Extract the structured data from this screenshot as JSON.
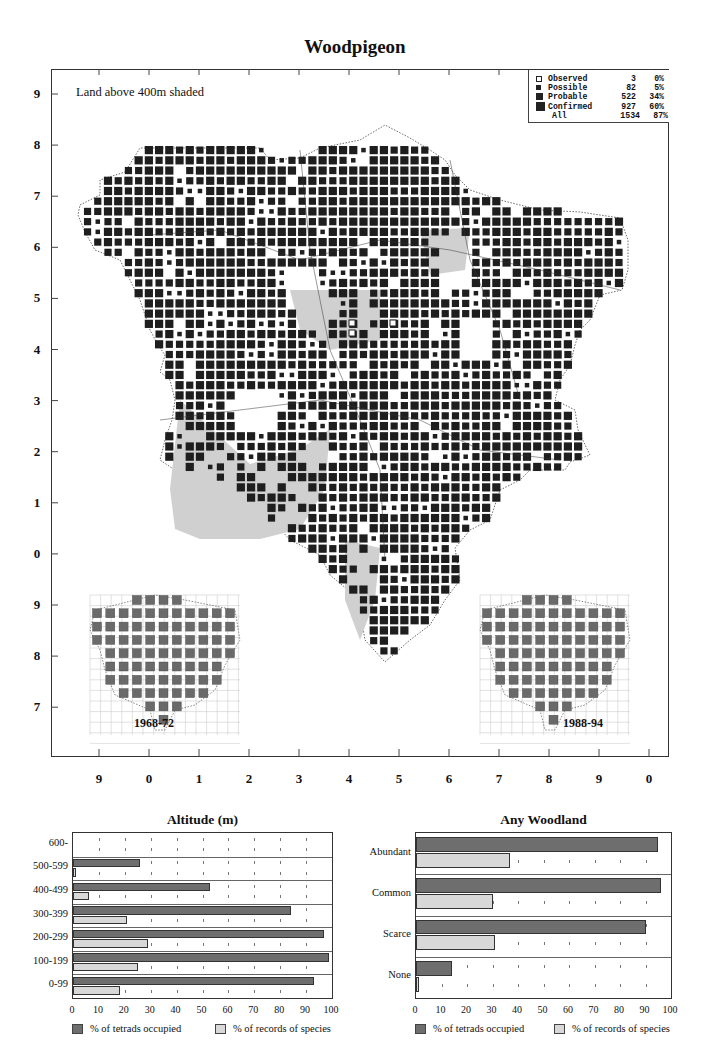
{
  "title": "Woodpigeon",
  "map": {
    "shade_note": "Land above 400m shaded",
    "y_ticks": [
      "9",
      "8",
      "7",
      "6",
      "5",
      "4",
      "3",
      "2",
      "1",
      "0",
      "9",
      "8",
      "7"
    ],
    "x_ticks": [
      "9",
      "0",
      "1",
      "2",
      "3",
      "4",
      "5",
      "6",
      "7",
      "8",
      "9",
      "0"
    ],
    "legend": [
      {
        "label": "Observed",
        "count": "3",
        "pct": "0%",
        "symbol": "open-square"
      },
      {
        "label": "Possible",
        "count": "82",
        "pct": "5%",
        "symbol": "small-square"
      },
      {
        "label": "Probable",
        "count": "522",
        "pct": "34%",
        "symbol": "medium-square"
      },
      {
        "label": "Confirmed",
        "count": "927",
        "pct": "60%",
        "symbol": "large-square"
      },
      {
        "label": "All",
        "count": "1534",
        "pct": "87%",
        "symbol": "none"
      }
    ],
    "insets": [
      {
        "label": "1968-72"
      },
      {
        "label": "1988-94"
      }
    ],
    "colors": {
      "breeding": "#1e1e1e",
      "shaded_land": "#d0d0d0",
      "inset_square": "#6a6a6a"
    }
  },
  "chart_data": [
    {
      "type": "bar",
      "orientation": "horizontal",
      "title": "Altitude (m)",
      "categories": [
        "600-",
        "500-599",
        "400-499",
        "300-399",
        "200-299",
        "100-199",
        "0-99"
      ],
      "series": [
        {
          "name": "% of tetrads occupied",
          "color": "#6e6e6e",
          "values": [
            0,
            26,
            53,
            84,
            97,
            99,
            93
          ]
        },
        {
          "name": "% of records of species",
          "color": "#d8d8d8",
          "values": [
            0,
            1,
            6,
            21,
            29,
            25,
            18
          ]
        }
      ],
      "xlim": [
        0,
        100
      ],
      "xticks": [
        "0",
        "10",
        "20",
        "30",
        "40",
        "50",
        "60",
        "70",
        "80",
        "90",
        "100"
      ],
      "grid": "dotted ticks",
      "legend_position": "bottom"
    },
    {
      "type": "bar",
      "orientation": "horizontal",
      "title": "Any Woodland",
      "categories": [
        "Abundant",
        "Common",
        "Scarce",
        "None"
      ],
      "series": [
        {
          "name": "% of tetrads occupied",
          "color": "#6e6e6e",
          "values": [
            95,
            96,
            90,
            14
          ]
        },
        {
          "name": "% of records of species",
          "color": "#d8d8d8",
          "values": [
            37,
            30,
            31,
            1
          ]
        }
      ],
      "xlim": [
        0,
        100
      ],
      "xticks": [
        "0",
        "10",
        "20",
        "30",
        "40",
        "50",
        "60",
        "70",
        "80",
        "90",
        "100"
      ],
      "grid": "dotted ticks",
      "legend_position": "bottom"
    }
  ]
}
